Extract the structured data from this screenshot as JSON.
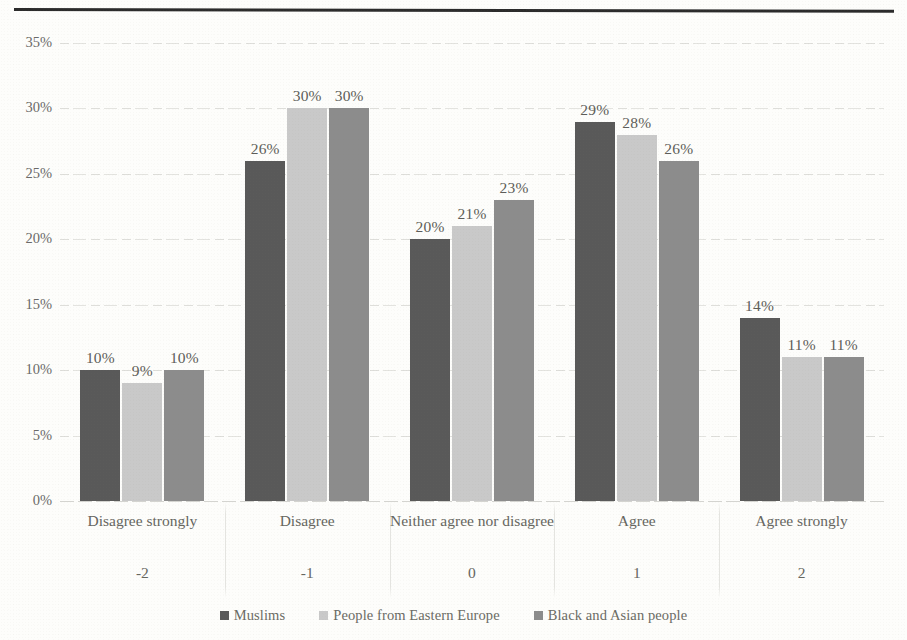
{
  "chart_data": {
    "type": "bar",
    "title": "",
    "subtitle": "",
    "xlabel": "",
    "ylabel": "",
    "ylim": [
      0,
      35
    ],
    "ytick_labels": [
      "0%",
      "5%",
      "10%",
      "15%",
      "20%",
      "25%",
      "30%",
      "35%"
    ],
    "ytick_values": [
      0,
      5,
      10,
      15,
      20,
      25,
      30,
      35
    ],
    "grid": true,
    "grid_axis": "y",
    "legend_position": "bottom",
    "value_label_suffix": "%",
    "categories": [
      "Disagree strongly",
      "Disagree",
      "Neither agree nor disagree",
      "Agree",
      "Agree strongly"
    ],
    "category_codes": [
      "-2",
      "-1",
      "0",
      "1",
      "2"
    ],
    "series": [
      {
        "name": "Muslims",
        "color": "#595959",
        "values": [
          10,
          26,
          20,
          29,
          14
        ],
        "labels": [
          "10%",
          "26%",
          "20%",
          "29%",
          "14%"
        ]
      },
      {
        "name": "People from Eastern Europe",
        "color": "#c9c9c9",
        "values": [
          9,
          30,
          21,
          28,
          11
        ],
        "labels": [
          "9%",
          "30%",
          "21%",
          "28%",
          "11%"
        ]
      },
      {
        "name": "Black and Asian people",
        "color": "#8c8c8c",
        "values": [
          10,
          30,
          23,
          26,
          11
        ],
        "labels": [
          "10%",
          "30%",
          "23%",
          "26%",
          "11%"
        ]
      }
    ]
  },
  "colors": {
    "series_1": "#595959",
    "series_2": "#c9c9c9",
    "series_3": "#8c8c8c",
    "axis_text": "#6a6a68",
    "gridline": "#dcdcd8",
    "rule": "#2b2b2b",
    "background": "#fdfdfb"
  }
}
